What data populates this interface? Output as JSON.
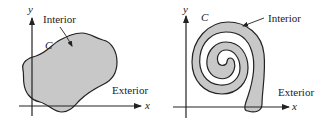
{
  "figure": {
    "panels": [
      {
        "id": "simple-region",
        "curve_label": "C",
        "interior_label": "Interior",
        "exterior_label": "Exterior",
        "x_axis_label": "x",
        "y_axis_label": "y"
      },
      {
        "id": "spiral-region",
        "curve_label": "C",
        "interior_label": "Interior",
        "exterior_label": "Exterior",
        "x_axis_label": "x",
        "y_axis_label": "y"
      }
    ],
    "colors": {
      "interior_fill": "#c8c8c8",
      "stroke": "#222222",
      "background": "#ffffff"
    }
  }
}
